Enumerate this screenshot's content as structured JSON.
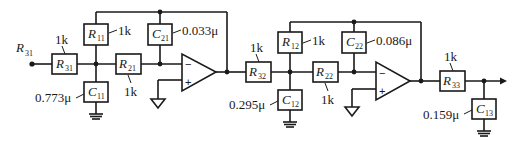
{
  "diagram": {
    "type": "circuit-schematic",
    "input_label": {
      "sym": "R",
      "sub": "31"
    },
    "stage1": {
      "R31": {
        "sym": "R",
        "sub": "31",
        "value": "1k"
      },
      "R11": {
        "sym": "R",
        "sub": "11",
        "value": "1k"
      },
      "C11": {
        "sym": "C",
        "sub": "11",
        "value": "0.773μ"
      },
      "R21": {
        "sym": "R",
        "sub": "21",
        "value": "1k"
      },
      "C21": {
        "sym": "C",
        "sub": "21",
        "value": "0.033μ"
      },
      "opamp": {
        "minus": "−",
        "plus": "+"
      }
    },
    "stage2": {
      "R32": {
        "sym": "R",
        "sub": "32",
        "value": "1k"
      },
      "R12": {
        "sym": "R",
        "sub": "12",
        "value": "1k"
      },
      "C12": {
        "sym": "C",
        "sub": "12",
        "value": "0.295μ"
      },
      "R22": {
        "sym": "R",
        "sub": "22",
        "value": "1k"
      },
      "C22": {
        "sym": "C",
        "sub": "22",
        "value": "0.086μ"
      },
      "opamp": {
        "minus": "−",
        "plus": "+"
      }
    },
    "stage3": {
      "R33": {
        "sym": "R",
        "sub": "33",
        "value": "1k"
      },
      "C13": {
        "sym": "C",
        "sub": "13",
        "value": "0.159μ"
      }
    }
  }
}
